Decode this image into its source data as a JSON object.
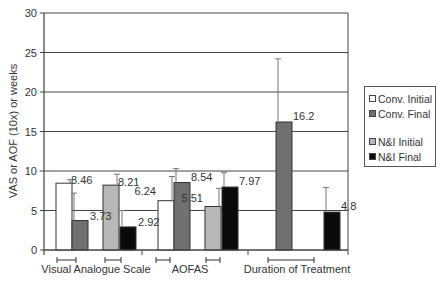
{
  "chart_data": {
    "type": "bar",
    "title": "",
    "xlabel": "",
    "ylabel": "VAS or AOF (10x) or weeks",
    "ylim": [
      0,
      30
    ],
    "yticks": [
      0,
      5,
      10,
      15,
      20,
      25,
      30
    ],
    "grid": true,
    "legend_position": "right",
    "categories": [
      "Visual Analogue Scale",
      "AOFAS",
      "Duration of Treatment"
    ],
    "series": [
      {
        "name": "Conv. Initial",
        "color": "#ffffff",
        "values": [
          8.46,
          6.24,
          null
        ],
        "labels": [
          "8.46",
          "6.24",
          null
        ],
        "error_top": [
          8.9,
          9.3,
          null
        ]
      },
      {
        "name": "Conv. Final",
        "color": "#707070",
        "values": [
          3.73,
          8.54,
          16.2
        ],
        "labels": [
          "3.73",
          "8.54",
          "16.2"
        ],
        "error_top": [
          7.2,
          10.3,
          24.2
        ]
      },
      {
        "name": "N&I Initial",
        "color": "#b8b8b8",
        "values": [
          8.21,
          5.51,
          null
        ],
        "labels": [
          "8.21",
          "5.51",
          null
        ],
        "error_top": [
          9.6,
          7.8,
          null
        ]
      },
      {
        "name": "N&I Final",
        "color": "#0a0a0a",
        "values": [
          2.92,
          7.97,
          4.8
        ],
        "labels": [
          "2.92",
          "7.97",
          "4.8"
        ],
        "error_top": [
          5.0,
          9.8,
          7.9
        ]
      }
    ]
  }
}
